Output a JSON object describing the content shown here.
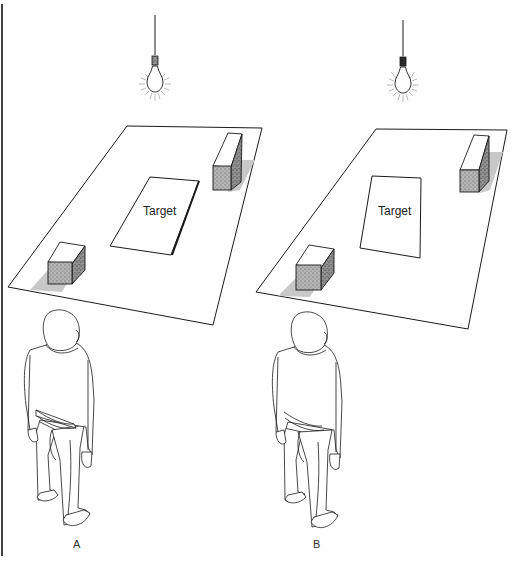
{
  "figure": {
    "panels": [
      {
        "id": "A",
        "label": "A",
        "target_label": "Target",
        "description": "Light bulb above table; target card tilted relative to table edges"
      },
      {
        "id": "B",
        "label": "B",
        "target_label": "Target",
        "description": "Light bulb above table; target card upright rectangle"
      }
    ],
    "colors": {
      "line": "#1a1a1a",
      "shadow": "#c8c8c8",
      "box_side": "#9a9a9a",
      "border": "#444444"
    }
  }
}
